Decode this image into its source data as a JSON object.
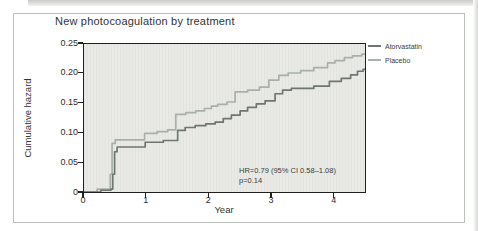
{
  "page": {
    "title": "New photocoagulation by treatment",
    "x_axis_label": "Year",
    "y_axis_label": "Cumulative hazard",
    "annotation": {
      "hr_text": "HR=0.79 (95% CI 0.58–1.08)",
      "p_text": "p=0.14"
    }
  },
  "legend": {
    "items": [
      {
        "label": "Atorvastatin",
        "color": "#6e7572"
      },
      {
        "label": "Placebo",
        "color": "#a9b0aa"
      }
    ]
  },
  "colors": {
    "atorvastatin_line": "#6e7572",
    "placebo_line": "#a9b0aa",
    "plot_background": "#e9eae5",
    "plot_border": "#202020",
    "frame_border": "#bcc0bc",
    "text": "#333333"
  },
  "chart_data": {
    "type": "line",
    "subtype": "step-after",
    "title": "New photocoagulation by treatment",
    "xlabel": "Year",
    "ylabel": "Cumulative hazard",
    "xlim": [
      0,
      4.5
    ],
    "ylim": [
      0,
      0.25
    ],
    "x_ticks": [
      0,
      1,
      2,
      3,
      4
    ],
    "x_tick_labels": [
      "0",
      "1",
      "2",
      "3",
      "4"
    ],
    "y_ticks": [
      0,
      0.05,
      0.1,
      0.15,
      0.2,
      0.25
    ],
    "y_tick_labels": [
      "0",
      "0.05",
      "0.10",
      "0.15",
      "0.20",
      "0.25"
    ],
    "grid": false,
    "legend_position": "outside-top-right",
    "annotations": [
      "HR=0.79 (95% CI 0.58–1.08)",
      "p=0.14"
    ],
    "series": [
      {
        "name": "Placebo",
        "color": "#a9b0aa",
        "points": [
          [
            0,
            0
          ],
          [
            0.21,
            0.005
          ],
          [
            0.42,
            0.03
          ],
          [
            0.45,
            0.082
          ],
          [
            0.5,
            0.088
          ],
          [
            0.97,
            0.099
          ],
          [
            1.17,
            0.102
          ],
          [
            1.34,
            0.105
          ],
          [
            1.47,
            0.131
          ],
          [
            1.63,
            0.134
          ],
          [
            1.79,
            0.137
          ],
          [
            1.93,
            0.141
          ],
          [
            2.04,
            0.145
          ],
          [
            2.14,
            0.148
          ],
          [
            2.29,
            0.152
          ],
          [
            2.42,
            0.169
          ],
          [
            2.62,
            0.172
          ],
          [
            2.81,
            0.177
          ],
          [
            2.96,
            0.189
          ],
          [
            3.12,
            0.197
          ],
          [
            3.27,
            0.201
          ],
          [
            3.47,
            0.205
          ],
          [
            3.68,
            0.21
          ],
          [
            3.9,
            0.218
          ],
          [
            4.02,
            0.222
          ],
          [
            4.17,
            0.227
          ],
          [
            4.3,
            0.23
          ],
          [
            4.45,
            0.233
          ],
          [
            4.5,
            0.233
          ]
        ]
      },
      {
        "name": "Atorvastatin",
        "color": "#6e7572",
        "points": [
          [
            0,
            0
          ],
          [
            0.27,
            0.003
          ],
          [
            0.43,
            0.005
          ],
          [
            0.46,
            0.03
          ],
          [
            0.49,
            0.068
          ],
          [
            0.53,
            0.076
          ],
          [
            0.98,
            0.084
          ],
          [
            1.27,
            0.087
          ],
          [
            1.5,
            0.104
          ],
          [
            1.62,
            0.109
          ],
          [
            1.78,
            0.112
          ],
          [
            1.95,
            0.115
          ],
          [
            2.1,
            0.118
          ],
          [
            2.23,
            0.124
          ],
          [
            2.36,
            0.13
          ],
          [
            2.5,
            0.137
          ],
          [
            2.62,
            0.143
          ],
          [
            2.76,
            0.149
          ],
          [
            2.9,
            0.154
          ],
          [
            3.06,
            0.166
          ],
          [
            3.18,
            0.172
          ],
          [
            3.32,
            0.175
          ],
          [
            3.68,
            0.179
          ],
          [
            3.93,
            0.187
          ],
          [
            4.12,
            0.192
          ],
          [
            4.27,
            0.198
          ],
          [
            4.38,
            0.204
          ],
          [
            4.47,
            0.207
          ],
          [
            4.5,
            0.208
          ]
        ]
      }
    ]
  }
}
